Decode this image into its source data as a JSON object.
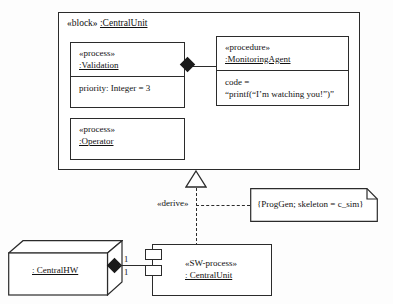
{
  "diagram": {
    "stroke_color": "#2b2b2b",
    "fill_color": "#ffffff",
    "background_color": "#fdfdfd"
  },
  "outer_block": {
    "stereotype": "«block»",
    "name": ":CentralUnit"
  },
  "parts": {
    "validation": {
      "stereotype": "«process»",
      "name": ":Validation",
      "attribute": "priority: Integer = 3"
    },
    "operator": {
      "stereotype": "«process»",
      "name": ":Operator"
    },
    "monitoring_agent": {
      "stereotype": "«procedure»",
      "name": ":MonitoringAgent",
      "code_label": "code =",
      "code_value": "“printf(“I’m watching you!”)”"
    }
  },
  "relationships": {
    "derive_label": "«derive»",
    "composition_multiplicity_hw": "1",
    "composition_multiplicity_sw": "1"
  },
  "note": {
    "text": "{ProgGen; skeleton = c_sim}"
  },
  "node_hw": {
    "name": ": CentralHW"
  },
  "component_sw": {
    "stereotype": "«SW-process»",
    "name": ": CentralUnit"
  }
}
